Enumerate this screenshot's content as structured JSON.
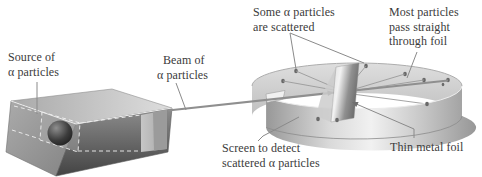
{
  "figure": {
    "background": "#ffffff",
    "text_color": "#3b3b3b"
  },
  "labels": {
    "source": {
      "line1": "Source of",
      "line2": "α particles"
    },
    "beam": {
      "line1": "Beam of",
      "line2": "α particles"
    },
    "scattered": {
      "line1": "Some α particles",
      "line2": "are scattered"
    },
    "straight": {
      "line1": "Most particles",
      "line2": "pass straight",
      "line3": "through foil"
    },
    "screen": {
      "line1": "Screen to detect",
      "line2": "scattered α particles"
    },
    "foil": {
      "line1": "Thin metal foil"
    }
  },
  "colors": {
    "leader_line": "#8a8a8a",
    "beam_line": "#8f8f8f",
    "particle_dot": "#696969",
    "metal_light": "#efefef",
    "metal_dark": "#9a9a9a"
  }
}
